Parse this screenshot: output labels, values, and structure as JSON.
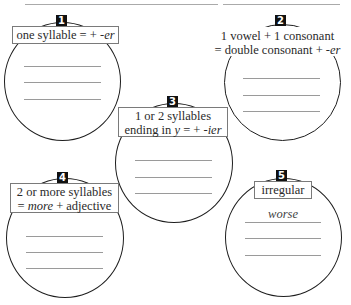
{
  "groups": [
    {
      "number": "1",
      "rule_parts": [
        "one syllable = + ",
        "-er"
      ],
      "answers": [
        "",
        "",
        ""
      ]
    },
    {
      "number": "2",
      "line1": "1 vowel + 1 consonant",
      "line2_parts": [
        "= double consonant + ",
        "-er"
      ],
      "answers": [
        "",
        "",
        ""
      ]
    },
    {
      "number": "3",
      "line1": "1 or 2 syllables",
      "line2_parts": [
        "ending in ",
        "y",
        " = + ",
        "-ier"
      ],
      "answers": [
        "",
        "",
        ""
      ]
    },
    {
      "number": "4",
      "line1": "2 or more syllables",
      "line2_parts": [
        "= ",
        "more",
        " + adjective"
      ],
      "answers": [
        "",
        "",
        ""
      ]
    },
    {
      "number": "5",
      "rule": "irregular",
      "answers": [
        "worse",
        "",
        ""
      ]
    }
  ]
}
